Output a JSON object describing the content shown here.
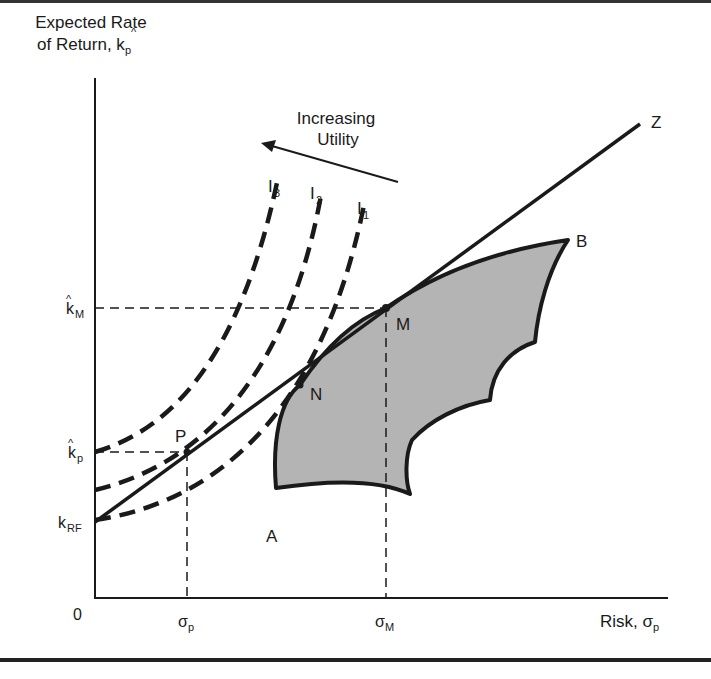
{
  "y_axis": {
    "title_line1": "Expected Rate",
    "title_line2": "of Return, k",
    "title_sub": "p",
    "ticks": [
      {
        "base": "k",
        "hat": true,
        "sub": "M"
      },
      {
        "base": "k",
        "hat": true,
        "sub": "p"
      },
      {
        "base": "k",
        "hat": false,
        "sub": "RF"
      }
    ]
  },
  "x_axis": {
    "title": "Risk, σ",
    "title_sub": "p",
    "origin": "0",
    "ticks": [
      {
        "base": "σ",
        "sub": "p"
      },
      {
        "base": "σ",
        "sub": "M"
      }
    ]
  },
  "annotation": {
    "line1": "Increasing",
    "line2": "Utility"
  },
  "curves": {
    "indifference": [
      {
        "base": "I",
        "sub": "3"
      },
      {
        "base": "I",
        "sub": "2"
      },
      {
        "base": "I",
        "sub": "1"
      }
    ],
    "capital_market_line_label": "Z"
  },
  "points": {
    "P": "P",
    "N": "N",
    "M": "M",
    "A": "A",
    "B": "B"
  },
  "colors": {
    "ink": "#1a1a1a",
    "feasible_fill": "#b4b4b4"
  }
}
